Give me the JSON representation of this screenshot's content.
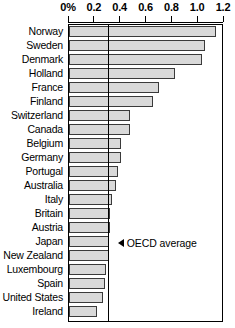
{
  "chart_data": {
    "type": "bar",
    "orientation": "horizontal",
    "title": "",
    "subtitle": "",
    "xlabel": "",
    "ylabel": "",
    "xlim": [
      0,
      1.2
    ],
    "grid": false,
    "legend": null,
    "tick_labels": [
      "0%",
      "0.2",
      "0.4",
      "0.6",
      "0.8",
      "1.0",
      "1.2"
    ],
    "tick_values": [
      0,
      0.2,
      0.4,
      0.6,
      0.8,
      1.0,
      1.2
    ],
    "categories": [
      "Norway",
      "Sweden",
      "Denmark",
      "Holland",
      "France",
      "Finland",
      "Switzerland",
      "Canada",
      "Belgium",
      "Germany",
      "Portugal",
      "Australia",
      "Italy",
      "Britain",
      "Austria",
      "Japan",
      "New Zealand",
      "Luxembourg",
      "Spain",
      "United States",
      "Ireland"
    ],
    "values": [
      1.14,
      1.05,
      1.03,
      0.82,
      0.7,
      0.65,
      0.47,
      0.47,
      0.4,
      0.4,
      0.38,
      0.36,
      0.33,
      0.32,
      0.32,
      0.31,
      0.31,
      0.29,
      0.28,
      0.26,
      0.22
    ],
    "annotations": [
      {
        "name": "oecd-average",
        "label": "OECD average",
        "marker": "left-triangle",
        "value": 0.3,
        "kind": "vertical-reference-line"
      }
    ],
    "colors": {
      "bar_fill": "#d9d9d9",
      "bar_stroke": "#3a3a3a",
      "axis": "#000000",
      "reference_line": "#000000"
    }
  }
}
